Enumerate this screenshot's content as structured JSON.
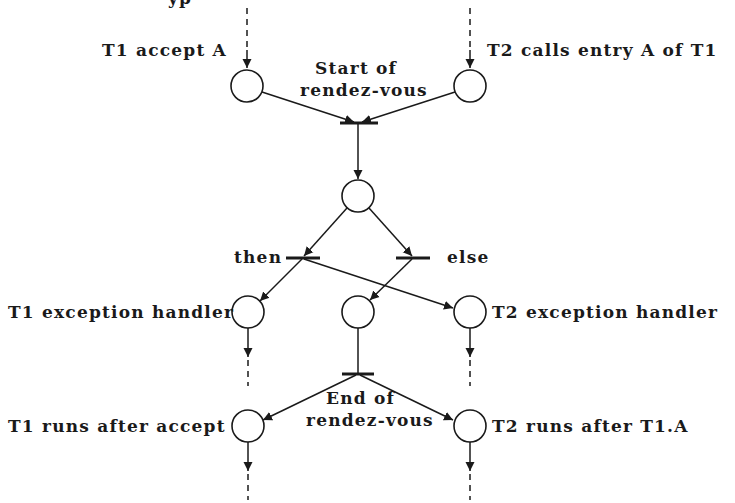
{
  "diagram": {
    "type": "petri-net",
    "top_cut_text": "yp",
    "labels": {
      "t1_accept": "T1 accept A",
      "t2_calls": "T2 calls entry A of T1",
      "start_line1": "Start of",
      "start_line2": "rendez-vous",
      "then": "then",
      "else": "else",
      "t1_exception": "T1 exception handler",
      "t2_exception": "T2 exception handler",
      "end_line1": "End of",
      "end_line2": "rendez-vous",
      "t1_runs_after": "T1 runs after accept",
      "t2_runs_after": "T2 runs after T1.A"
    },
    "places": [
      {
        "id": "t1-accept-place",
        "label": "T1 accept A"
      },
      {
        "id": "t2-call-place",
        "label": "T2 calls entry A of T1"
      },
      {
        "id": "rendezvous-place",
        "label": ""
      },
      {
        "id": "t1-exception-place",
        "label": "T1 exception handler"
      },
      {
        "id": "else-place",
        "label": ""
      },
      {
        "id": "t2-exception-place",
        "label": "T2 exception handler"
      },
      {
        "id": "t1-after-place",
        "label": "T1 runs after accept"
      },
      {
        "id": "t2-after-place",
        "label": "T2 runs after T1.A"
      }
    ],
    "transitions": [
      {
        "id": "start-rendezvous",
        "label": "Start of rendez-vous"
      },
      {
        "id": "then-transition",
        "label": "then"
      },
      {
        "id": "else-transition",
        "label": "else"
      },
      {
        "id": "end-rendezvous",
        "label": "End of rendez-vous"
      }
    ],
    "colors": {
      "ink": "#1a1a1a",
      "background": "#ffffff"
    }
  }
}
